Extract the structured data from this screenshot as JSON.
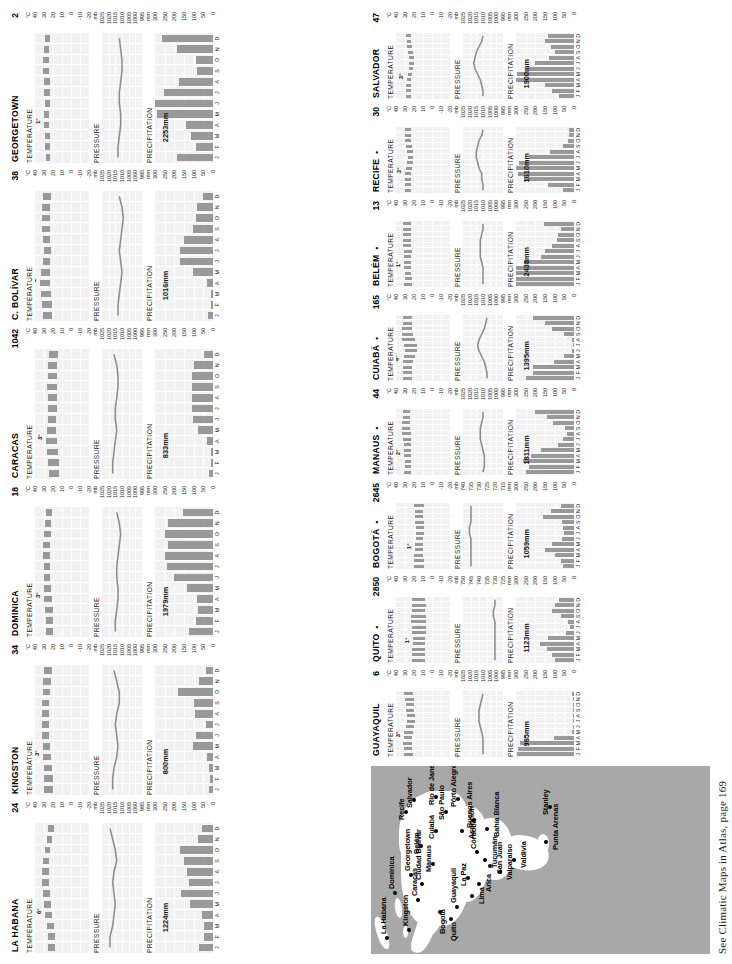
{
  "caption": "See Climatic Maps in Atlas, page 169",
  "sections": {
    "temperature": "TEMPERATURE",
    "pressure": "PRESSURE",
    "precipitation": "PRECIPITATION"
  },
  "units": {
    "temp": "°C",
    "pressure": "mb",
    "precip": "mm"
  },
  "months": [
    "J",
    "F",
    "M",
    "A",
    "M",
    "J",
    "J",
    "A",
    "S",
    "O",
    "N",
    "D"
  ],
  "axes": {
    "temp_ticks": [
      "40",
      "30",
      "20",
      "10",
      "0",
      "-10",
      "-20"
    ],
    "pressure_ticks_sea": [
      "1025",
      "1020",
      "1015",
      "1010",
      "1005",
      "1000",
      "995"
    ],
    "pressure_ticks_quito": [
      "750",
      "745",
      "740",
      "735",
      "730",
      "725"
    ],
    "pressure_ticks_bogota": [
      "740",
      "735",
      "730",
      "725",
      "720",
      "715"
    ],
    "precip_ticks": [
      "300",
      "250",
      "200",
      "150",
      "100",
      "50",
      "0"
    ]
  },
  "colors": {
    "bar": "#999999",
    "plot_bg": "#f2f2f2",
    "grid": "#ffffff",
    "map_sea": "#a8a8a8",
    "map_land": "#ffffff",
    "text": "#111111"
  },
  "map": {
    "cities": [
      {
        "name": "La Habana",
        "x": 14,
        "y": 14,
        "lx": 20,
        "ly": 8
      },
      {
        "name": "Kingston",
        "x": 22,
        "y": 36,
        "lx": 28,
        "ly": 30
      },
      {
        "name": "Dominica",
        "x": 59,
        "y": 22,
        "lx": 65,
        "ly": 16
      },
      {
        "name": "Caracas",
        "x": 52,
        "y": 45,
        "lx": 58,
        "ly": 39
      },
      {
        "name": "Georgetown",
        "x": 77,
        "y": 38,
        "lx": 83,
        "ly": 32
      },
      {
        "name": "Ciudad Bolívar",
        "x": 68,
        "y": 49,
        "lx": 74,
        "ly": 43
      },
      {
        "name": "Bogotá",
        "x": 40,
        "y": 67,
        "lx": 20,
        "ly": 67
      },
      {
        "name": "Quito",
        "x": 33,
        "y": 78,
        "lx": 13,
        "ly": 78
      },
      {
        "name": "Belém",
        "x": 106,
        "y": 48,
        "lx": 100,
        "ly": 41
      },
      {
        "name": "Recife",
        "x": 140,
        "y": 33,
        "lx": 134,
        "ly": 26
      },
      {
        "name": "Salvador",
        "x": 152,
        "y": 41,
        "lx": 146,
        "ly": 34
      },
      {
        "name": "Manaus",
        "x": 88,
        "y": 60,
        "lx": 82,
        "ly": 53
      },
      {
        "name": "Guayaquil",
        "x": 45,
        "y": 84,
        "lx": 51,
        "ly": 78
      },
      {
        "name": "Cuiabá",
        "x": 121,
        "y": 63,
        "lx": 115,
        "ly": 56
      },
      {
        "name": "Lima",
        "x": 56,
        "y": 99,
        "lx": 50,
        "ly": 106
      },
      {
        "name": "La Paz",
        "x": 74,
        "y": 95,
        "lx": 68,
        "ly": 88
      },
      {
        "name": "Arica",
        "x": 68,
        "y": 106,
        "lx": 62,
        "ly": 113
      },
      {
        "name": "São Paulo",
        "x": 140,
        "y": 73,
        "lx": 134,
        "ly": 66
      },
      {
        "name": "Rio de Janeiro",
        "x": 155,
        "y": 63,
        "lx": 149,
        "ly": 56
      },
      {
        "name": "Asunción",
        "x": 121,
        "y": 89,
        "lx": 115,
        "ly": 96
      },
      {
        "name": "Tucumán",
        "x": 92,
        "y": 112,
        "lx": 86,
        "ly": 119
      },
      {
        "name": "Córdoba",
        "x": 100,
        "y": 104,
        "lx": 105,
        "ly": 98
      },
      {
        "name": "Pôrto Alegre",
        "x": 153,
        "y": 85,
        "lx": 147,
        "ly": 78
      },
      {
        "name": "San Juan",
        "x": 86,
        "y": 117,
        "lx": 80,
        "ly": 124
      },
      {
        "name": "Valparaíso",
        "x": 80,
        "y": 127,
        "lx": 74,
        "ly": 134
      },
      {
        "name": "Buenos Aires",
        "x": 132,
        "y": 101,
        "lx": 126,
        "ly": 94
      },
      {
        "name": "Bahía Blanca",
        "x": 123,
        "y": 114,
        "lx": 117,
        "ly": 121
      },
      {
        "name": "Valdivia",
        "x": 92,
        "y": 141,
        "lx": 86,
        "ly": 148
      },
      {
        "name": "Punta Arenas",
        "x": 110,
        "y": 173,
        "lx": 104,
        "ly": 180
      },
      {
        "name": "Stanley",
        "x": 145,
        "y": 177,
        "lx": 139,
        "ly": 170
      }
    ]
  },
  "stations": [
    {
      "name": "LA HABANA",
      "altitude": "24",
      "has_dot": false,
      "temp_annot": "6°",
      "temp_min": [
        18,
        18,
        19,
        21,
        22,
        23,
        24,
        24,
        24,
        23,
        21,
        19
      ],
      "temp_max": [
        26,
        26,
        27,
        29,
        30,
        31,
        32,
        32,
        31,
        29,
        27,
        26
      ],
      "pressure_scale": "sea",
      "pressure": [
        1019,
        1019,
        1017,
        1016,
        1015,
        1016,
        1017,
        1016,
        1014,
        1015,
        1017,
        1019
      ],
      "precip_total": "1224mm",
      "precip": [
        71,
        46,
        46,
        58,
        119,
        165,
        125,
        135,
        150,
        173,
        79,
        58
      ]
    },
    {
      "name": "KINGSTON",
      "altitude": "34",
      "has_dot": false,
      "temp_annot": "3°",
      "temp_min": [
        20,
        20,
        21,
        22,
        23,
        24,
        24,
        24,
        24,
        23,
        22,
        21
      ],
      "temp_max": [
        30,
        30,
        30,
        31,
        31,
        32,
        32,
        32,
        32,
        31,
        31,
        30
      ],
      "pressure_scale": "sea",
      "pressure": [
        1017,
        1017,
        1016,
        1014,
        1013,
        1014,
        1015,
        1014,
        1012,
        1012,
        1014,
        1016
      ],
      "precip_total": "800mm",
      "precip": [
        23,
        15,
        23,
        31,
        102,
        89,
        38,
        91,
        99,
        180,
        74,
        36
      ]
    },
    {
      "name": "DOMINICA",
      "altitude": "18",
      "has_dot": false,
      "temp_annot": "3°",
      "temp_min": [
        20,
        20,
        20,
        21,
        22,
        23,
        23,
        23,
        23,
        22,
        22,
        21
      ],
      "temp_max": [
        28,
        28,
        29,
        30,
        30,
        30,
        30,
        31,
        31,
        30,
        29,
        28
      ],
      "pressure_scale": "sea",
      "pressure": [
        1015,
        1015,
        1014,
        1013,
        1013,
        1014,
        1014,
        1013,
        1012,
        1011,
        1012,
        1014
      ],
      "precip_total": "1979mm",
      "precip": [
        125,
        86,
        76,
        84,
        137,
        203,
        236,
        246,
        234,
        249,
        231,
        155
      ]
    },
    {
      "name": "CARACAS",
      "altitude": "1042",
      "has_dot": false,
      "temp_annot": "3°",
      "temp_min": [
        13,
        13,
        14,
        16,
        17,
        17,
        16,
        16,
        16,
        16,
        16,
        14
      ],
      "temp_max": [
        25,
        26,
        27,
        28,
        27,
        26,
        26,
        26,
        27,
        26,
        26,
        25
      ],
      "pressure_scale": "sea",
      "pressure": [
        1017,
        1017,
        1016,
        1015,
        1014,
        1015,
        1015,
        1014,
        1013,
        1013,
        1014,
        1016
      ],
      "precip_total": "833mm",
      "precip": [
        23,
        10,
        10,
        33,
        79,
        102,
        109,
        109,
        107,
        109,
        97,
        46
      ]
    },
    {
      "name": "C. BOLÍVAR",
      "altitude": "38",
      "has_dot": false,
      "temp_annot": "2°",
      "temp_min": [
        21,
        21,
        22,
        23,
        23,
        23,
        22,
        23,
        23,
        23,
        23,
        22
      ],
      "temp_max": [
        31,
        32,
        33,
        34,
        33,
        31,
        30,
        31,
        32,
        32,
        32,
        31
      ],
      "pressure_scale": "sea",
      "pressure": [
        1013,
        1013,
        1012,
        1011,
        1010,
        1011,
        1012,
        1011,
        1010,
        1009,
        1010,
        1012
      ],
      "precip_total": "1016mm",
      "precip": [
        25,
        10,
        10,
        30,
        102,
        170,
        173,
        152,
        102,
        89,
        84,
        51
      ]
    },
    {
      "name": "GEORGETOWN",
      "altitude": "2",
      "has_dot": false,
      "temp_annot": "1°",
      "temp_min": [
        23,
        23,
        23,
        24,
        24,
        23,
        23,
        23,
        24,
        24,
        24,
        23
      ],
      "temp_max": [
        28,
        29,
        29,
        30,
        30,
        29,
        30,
        30,
        31,
        31,
        30,
        29
      ],
      "pressure_scale": "sea",
      "pressure": [
        1013,
        1013,
        1012,
        1011,
        1011,
        1012,
        1012,
        1011,
        1010,
        1010,
        1011,
        1012
      ],
      "precip_total": "2253mm",
      "precip": [
        185,
        89,
        112,
        140,
        292,
        302,
        254,
        175,
        81,
        86,
        185,
        262
      ]
    },
    {
      "name": "GUAYAQUIL",
      "altitude": "6",
      "has_dot": false,
      "temp_annot": "3°",
      "temp_min": [
        21,
        22,
        22,
        22,
        21,
        20,
        19,
        19,
        20,
        20,
        20,
        21
      ],
      "temp_max": [
        31,
        31,
        32,
        31,
        31,
        29,
        28,
        28,
        29,
        29,
        30,
        31
      ],
      "pressure_scale": "sea",
      "pressure": [
        1010,
        1010,
        1010,
        1010,
        1011,
        1012,
        1013,
        1013,
        1013,
        1012,
        1011,
        1010
      ],
      "precip_total": "985mm",
      "precip": [
        295,
        290,
        277,
        102,
        10,
        3,
        1,
        1,
        1,
        1,
        2,
        13
      ]
    },
    {
      "name": "QUITO",
      "altitude": "2850",
      "has_dot": true,
      "temp_annot": "1°",
      "temp_min": [
        8,
        8,
        8,
        8,
        8,
        7,
        7,
        7,
        7,
        8,
        7,
        8
      ],
      "temp_max": [
        22,
        22,
        22,
        21,
        21,
        22,
        22,
        23,
        23,
        22,
        22,
        22
      ],
      "pressure_scale": "quito",
      "pressure": [
        730,
        730,
        730,
        730,
        730,
        730,
        730,
        730,
        731,
        731,
        730,
        730
      ],
      "precip_total": "1123mm",
      "precip": [
        99,
        112,
        142,
        175,
        137,
        43,
        20,
        31,
        69,
        112,
        97,
        79
      ]
    },
    {
      "name": "BOGOTÁ",
      "altitude": "2645",
      "has_dot": true,
      "temp_annot": "1°",
      "temp_min": [
        9,
        9,
        10,
        10,
        10,
        10,
        9,
        9,
        9,
        10,
        10,
        9
      ],
      "temp_max": [
        20,
        20,
        20,
        19,
        19,
        18,
        18,
        18,
        19,
        19,
        19,
        20
      ],
      "pressure_scale": "bogota",
      "pressure": [
        735,
        735,
        735,
        735,
        735,
        735,
        736,
        736,
        735,
        735,
        735,
        735
      ],
      "precip_total": "1059mm",
      "precip": [
        58,
        66,
        99,
        150,
        114,
        61,
        51,
        56,
        61,
        160,
        117,
        66
      ]
    },
    {
      "name": "MANAUS",
      "altitude": "44",
      "has_dot": true,
      "temp_annot": "2°",
      "temp_min": [
        23,
        23,
        23,
        23,
        23,
        23,
        23,
        23,
        24,
        24,
        24,
        24
      ],
      "temp_max": [
        31,
        30,
        30,
        31,
        31,
        31,
        32,
        33,
        33,
        33,
        32,
        32
      ],
      "pressure_scale": "sea",
      "pressure": [
        1010,
        1009,
        1009,
        1009,
        1010,
        1011,
        1012,
        1012,
        1012,
        1011,
        1010,
        1010
      ],
      "precip_total": "1811mm",
      "precip": [
        249,
        231,
        262,
        221,
        170,
        84,
        58,
        38,
        46,
        107,
        142,
        203
      ]
    },
    {
      "name": "CUIABÁ",
      "altitude": "165",
      "has_dot": true,
      "temp_annot": "4°",
      "temp_min": [
        22,
        22,
        22,
        21,
        19,
        17,
        17,
        19,
        21,
        22,
        22,
        22
      ],
      "temp_max": [
        32,
        32,
        32,
        32,
        31,
        30,
        31,
        33,
        33,
        33,
        32,
        32
      ],
      "pressure_scale": "sea",
      "pressure": [
        1007,
        1007,
        1008,
        1009,
        1011,
        1013,
        1014,
        1013,
        1011,
        1009,
        1008,
        1007
      ],
      "precip_total": "1395mm",
      "precip": [
        249,
        211,
        211,
        102,
        53,
        8,
        5,
        10,
        51,
        114,
        150,
        211
      ]
    },
    {
      "name": "BELÉM",
      "altitude": "13",
      "has_dot": true,
      "temp_annot": "1°",
      "temp_min": [
        22,
        22,
        23,
        23,
        23,
        23,
        22,
        23,
        23,
        23,
        23,
        23
      ],
      "temp_max": [
        31,
        30,
        30,
        31,
        31,
        31,
        31,
        32,
        32,
        32,
        32,
        32
      ],
      "pressure_scale": "sea",
      "pressure": [
        1010,
        1010,
        1010,
        1010,
        1011,
        1012,
        1012,
        1012,
        1012,
        1011,
        1010,
        1010
      ],
      "precip_total": "2438mm",
      "precip": [
        318,
        358,
        358,
        320,
        259,
        170,
        150,
        112,
        89,
        84,
        66,
        155
      ]
    },
    {
      "name": "RECIFE",
      "altitude": "30",
      "has_dot": true,
      "temp_annot": "3°",
      "temp_min": [
        23,
        23,
        23,
        23,
        22,
        21,
        21,
        21,
        22,
        23,
        23,
        23
      ],
      "temp_max": [
        30,
        30,
        30,
        30,
        29,
        28,
        27,
        28,
        29,
        30,
        30,
        30
      ],
      "pressure_scale": "sea",
      "pressure": [
        1010,
        1010,
        1011,
        1011,
        1013,
        1014,
        1015,
        1015,
        1014,
        1013,
        1011,
        1010
      ],
      "precip_total": "1610mm",
      "precip": [
        56,
        137,
        259,
        292,
        305,
        282,
        231,
        122,
        58,
        33,
        25,
        28
      ]
    },
    {
      "name": "SALVADOR",
      "altitude": "47",
      "has_dot": false,
      "temp_annot": "3°",
      "temp_min": [
        23,
        23,
        23,
        23,
        22,
        21,
        20,
        20,
        21,
        22,
        23,
        23
      ],
      "temp_max": [
        29,
        29,
        29,
        28,
        27,
        26,
        26,
        26,
        27,
        28,
        28,
        29
      ],
      "pressure_scale": "sea",
      "pressure": [
        1010,
        1010,
        1011,
        1012,
        1014,
        1016,
        1017,
        1016,
        1015,
        1013,
        1011,
        1010
      ],
      "precip_total": "1900mm",
      "precip": [
        79,
        114,
        150,
        310,
        297,
        244,
        203,
        127,
        97,
        117,
        150,
        137
      ]
    }
  ]
}
